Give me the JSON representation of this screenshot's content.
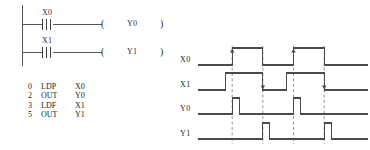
{
  "ladder": {
    "rungs": [
      {
        "contact_label": "X0",
        "contact_type": "pulse-rising-contact",
        "coil_label": "Y0",
        "coil_open": "(",
        "coil_close": ")"
      },
      {
        "contact_label": "X1",
        "contact_type": "pulse-falling-contact",
        "coil_label": "Y1",
        "coil_open": "(",
        "coil_close": ")"
      }
    ]
  },
  "instruction_list": {
    "rows": [
      {
        "step": "0",
        "op": "LDP",
        "operand": "X0"
      },
      {
        "step": "2",
        "op": "OUT",
        "operand": "Y0"
      },
      {
        "step": "3",
        "op": "LDF",
        "operand": "X1"
      },
      {
        "step": "5",
        "op": "OUT",
        "operand": "Y1"
      }
    ]
  },
  "timing": {
    "labels": {
      "x0": "X0",
      "x1": "X1",
      "y0": "Y0",
      "y1": "Y1"
    },
    "line_color": "#4a4a4a",
    "dash_color": "#8a8a8a"
  },
  "chart_data": {
    "type": "line",
    "title": "",
    "xlabel": "",
    "ylabel": "",
    "xlim": [
      0,
      194
    ],
    "ylim": [
      0,
      1
    ],
    "grid": false,
    "legend": "none",
    "series": [
      {
        "name": "X0",
        "type": "digital",
        "transitions": [
          [
            0,
            0
          ],
          [
            39,
            1
          ],
          [
            74,
            0
          ],
          [
            109,
            1
          ],
          [
            144,
            0
          ],
          [
            194,
            0
          ]
        ]
      },
      {
        "name": "X1",
        "type": "digital",
        "transitions": [
          [
            0,
            0
          ],
          [
            31,
            1
          ],
          [
            74,
            0
          ],
          [
            101,
            1
          ],
          [
            144,
            0
          ],
          [
            194,
            0
          ]
        ]
      },
      {
        "name": "Y0",
        "type": "digital",
        "transitions": [
          [
            0,
            0
          ],
          [
            39,
            1
          ],
          [
            47,
            0
          ],
          [
            109,
            1
          ],
          [
            117,
            0
          ],
          [
            194,
            0
          ]
        ]
      },
      {
        "name": "Y1",
        "type": "digital",
        "transitions": [
          [
            0,
            0
          ],
          [
            74,
            1
          ],
          [
            82,
            0
          ],
          [
            144,
            1
          ],
          [
            152,
            0
          ],
          [
            194,
            0
          ]
        ]
      }
    ],
    "annotations": [
      {
        "type": "vertical-dashed",
        "x": 39,
        "note": "X0 rising edge -> Y0 pulse"
      },
      {
        "type": "vertical-dashed",
        "x": 74,
        "note": "X1 falling edge -> Y1 pulse"
      },
      {
        "type": "vertical-dashed",
        "x": 109,
        "note": "X0 rising edge -> Y0 pulse"
      },
      {
        "type": "vertical-dashed",
        "x": 144,
        "note": "X1 falling edge -> Y1 pulse"
      }
    ]
  }
}
